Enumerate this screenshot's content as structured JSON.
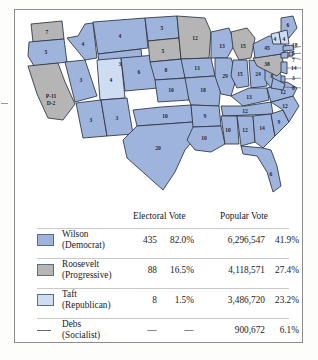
{
  "figure": {
    "colors": {
      "democrat_blue": "#9fb4dd",
      "progressive_gray": "#b5b5b5",
      "republican_light_blue": "#cfddf2",
      "state_border": "#2b3340",
      "frame": "#8c8c8c",
      "background": "#ffffff"
    }
  },
  "map": {
    "states": [
      {
        "name": "washington",
        "label": "7",
        "party": "progressive"
      },
      {
        "name": "oregon",
        "label": "5",
        "party": "democrat"
      },
      {
        "name": "california",
        "label": "P-11",
        "label2": "D-2",
        "party": "progressive"
      },
      {
        "name": "nevada",
        "label": "3",
        "party": "democrat"
      },
      {
        "name": "idaho",
        "label": "4",
        "party": "democrat"
      },
      {
        "name": "montana",
        "label": "4",
        "party": "democrat"
      },
      {
        "name": "wyoming",
        "label": "3",
        "party": "democrat"
      },
      {
        "name": "utah",
        "label": "4",
        "party": "republican"
      },
      {
        "name": "arizona",
        "label": "3",
        "party": "democrat"
      },
      {
        "name": "new-mexico",
        "label": "3",
        "party": "democrat"
      },
      {
        "name": "colorado",
        "label": "6",
        "party": "democrat"
      },
      {
        "name": "north-dakota",
        "label": "5",
        "party": "democrat"
      },
      {
        "name": "south-dakota",
        "label": "5",
        "party": "progressive"
      },
      {
        "name": "nebraska",
        "label": "8",
        "party": "democrat"
      },
      {
        "name": "kansas",
        "label": "10",
        "party": "democrat"
      },
      {
        "name": "oklahoma",
        "label": "10",
        "party": "democrat"
      },
      {
        "name": "texas",
        "label": "20",
        "party": "democrat"
      },
      {
        "name": "minnesota",
        "label": "12",
        "party": "progressive"
      },
      {
        "name": "iowa",
        "label": "13",
        "party": "democrat"
      },
      {
        "name": "missouri",
        "label": "18",
        "party": "democrat"
      },
      {
        "name": "arkansas",
        "label": "9",
        "party": "democrat"
      },
      {
        "name": "louisiana",
        "label": "10",
        "party": "democrat"
      },
      {
        "name": "wisconsin",
        "label": "13",
        "party": "democrat"
      },
      {
        "name": "illinois",
        "label": "29",
        "party": "democrat"
      },
      {
        "name": "michigan",
        "label": "15",
        "party": "progressive"
      },
      {
        "name": "indiana",
        "label": "15",
        "party": "democrat"
      },
      {
        "name": "ohio",
        "label": "24",
        "party": "democrat"
      },
      {
        "name": "kentucky",
        "label": "13",
        "party": "democrat"
      },
      {
        "name": "tennessee",
        "label": "12",
        "party": "democrat"
      },
      {
        "name": "mississippi",
        "label": "10",
        "party": "democrat"
      },
      {
        "name": "alabama",
        "label": "12",
        "party": "democrat"
      },
      {
        "name": "georgia",
        "label": "14",
        "party": "democrat"
      },
      {
        "name": "florida",
        "label": "6",
        "party": "democrat"
      },
      {
        "name": "south-carolina",
        "label": "9",
        "party": "democrat"
      },
      {
        "name": "north-carolina",
        "label": "12",
        "party": "democrat"
      },
      {
        "name": "virginia",
        "label": "12",
        "party": "democrat"
      },
      {
        "name": "west-virginia",
        "label": "8",
        "party": "democrat"
      },
      {
        "name": "pennsylvania",
        "label": "38",
        "party": "progressive"
      },
      {
        "name": "new-york",
        "label": "45",
        "party": "democrat"
      },
      {
        "name": "maine",
        "label": "6",
        "party": "democrat"
      },
      {
        "name": "vermont",
        "label": "4",
        "party": "republican"
      },
      {
        "name": "new-hampshire",
        "label": "4",
        "party": "republican"
      }
    ],
    "callouts": [
      {
        "name": "massachusetts",
        "label": "18"
      },
      {
        "name": "rhode-island",
        "label": "5"
      },
      {
        "name": "connecticut",
        "label": "7"
      },
      {
        "name": "new-jersey",
        "label": "14"
      },
      {
        "name": "delaware",
        "label": "3"
      },
      {
        "name": "maryland",
        "label": "8"
      }
    ]
  },
  "legend": {
    "headers": {
      "electoral": "Electoral Vote",
      "popular": "Popular Vote"
    },
    "rows": [
      {
        "candidate": "Wilson",
        "party": "(Democrat)",
        "swatch": "democrat",
        "electoral_votes": "435",
        "electoral_pct": "82.0%",
        "popular_votes": "6,296,547",
        "popular_pct": "41.9%"
      },
      {
        "candidate": "Roosevelt",
        "party": "(Progressive)",
        "swatch": "progressive",
        "electoral_votes": "88",
        "electoral_pct": "16.5%",
        "popular_votes": "4,118,571",
        "popular_pct": "27.4%"
      },
      {
        "candidate": "Taft",
        "party": "(Republican)",
        "swatch": "republican",
        "electoral_votes": "8",
        "electoral_pct": "1.5%",
        "popular_votes": "3,486,720",
        "popular_pct": "23.2%"
      },
      {
        "candidate": "Debs",
        "party": "(Socialist)",
        "swatch": "dash",
        "electoral_votes": "—",
        "electoral_pct": "—",
        "popular_votes": "900,672",
        "popular_pct": "6.1%"
      }
    ]
  }
}
